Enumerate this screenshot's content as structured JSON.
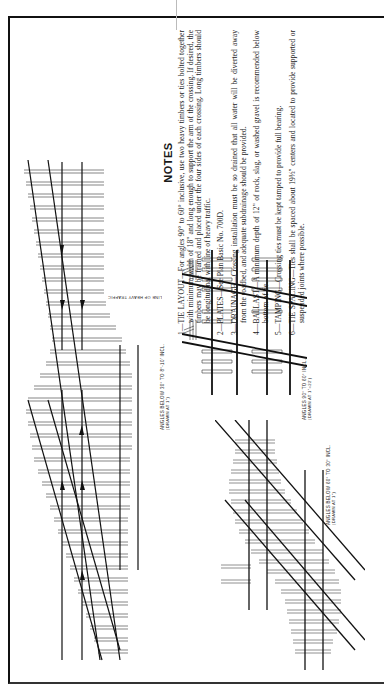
{
  "document": {
    "orientation": "rotated 90° counter-clockwise",
    "notes": {
      "title": "NOTES",
      "items": [
        {
          "num": "1—",
          "heading": "TIE LAYOUT—",
          "text": "For angles 90° to 60° inclusive, use two heavy timbers or ties bolted together with minimum width of 18\" and long enough to support the arm of the crossing. If desired, the timbers may be framed and placed under the four sides of each crossing. Long timbers should be longitudinal with line of heavy traffic."
        },
        {
          "num": "2—",
          "heading": "PLATES—",
          "text": "See Plan Basic No. 700D."
        },
        {
          "num": "3—",
          "heading": "DRAINAGE—",
          "text": "Crossing installation must be so drained that all water will be diverted away from the roadbed, and adequate subdrainage should be provided."
        },
        {
          "num": "4—",
          "heading": "BALLAST—",
          "text": "A minimum depth of 12\" of rock, slag, or washed gravel is recommended below bottom of tie."
        },
        {
          "num": "5—",
          "heading": "TAMPING—",
          "text": "Crossing ties must be kept tamped to provide full bearing."
        },
        {
          "num": "6—",
          "heading": "TIE SPACING—",
          "text": "Ties shall be spaced about 19½\" centers and located to provide supported or suspended joints where possible."
        }
      ]
    },
    "diagrams": [
      {
        "id": "large-crossing",
        "label": "ANGLES BELOW 30° TO 8°-10' INCL.",
        "scale": "(DRAWN AT 1\")"
      },
      {
        "id": "right-angle-crossing",
        "label": "ANGLES 90° TO 60° INCL.",
        "scale": "(DRAWN AT 1\"=22')",
        "annotation": "LINE OF HEAVY TRAFFIC"
      },
      {
        "id": "medium-crossing",
        "label": "ANGLES BELOW 60° TO 30° INCL.",
        "scale": "(DRAWN AT 1\")"
      }
    ]
  }
}
